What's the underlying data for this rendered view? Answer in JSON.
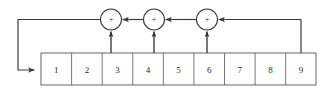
{
  "diagram": {
    "type": "linear-feedback-shift-register",
    "title": "",
    "background_color": "#ffffff",
    "line_color": "#3c3c3c",
    "box_line_color": "#555555",
    "text_color": "#2b2b2b",
    "register": {
      "cell_count": 9,
      "cells": [
        {
          "label": "1"
        },
        {
          "label": "2"
        },
        {
          "label": "3"
        },
        {
          "label": "4"
        },
        {
          "label": "5"
        },
        {
          "label": "6"
        },
        {
          "label": "7"
        },
        {
          "label": "8"
        },
        {
          "label": "9"
        }
      ]
    },
    "xor_gates": [
      {
        "id": "xor-1",
        "symbol": "+"
      },
      {
        "id": "xor-2",
        "symbol": "+"
      },
      {
        "id": "xor-3",
        "symbol": "+"
      }
    ],
    "taps": [
      {
        "from_cell": "3",
        "to_gate": "xor-1"
      },
      {
        "from_cell": "4",
        "to_gate": "xor-2"
      },
      {
        "from_cell": "6",
        "to_gate": "xor-3"
      }
    ],
    "feedback": {
      "source_cell": "9",
      "target_cell": "1",
      "description": "output of stage 9 feeds back through the XOR chain into stage 1"
    }
  }
}
